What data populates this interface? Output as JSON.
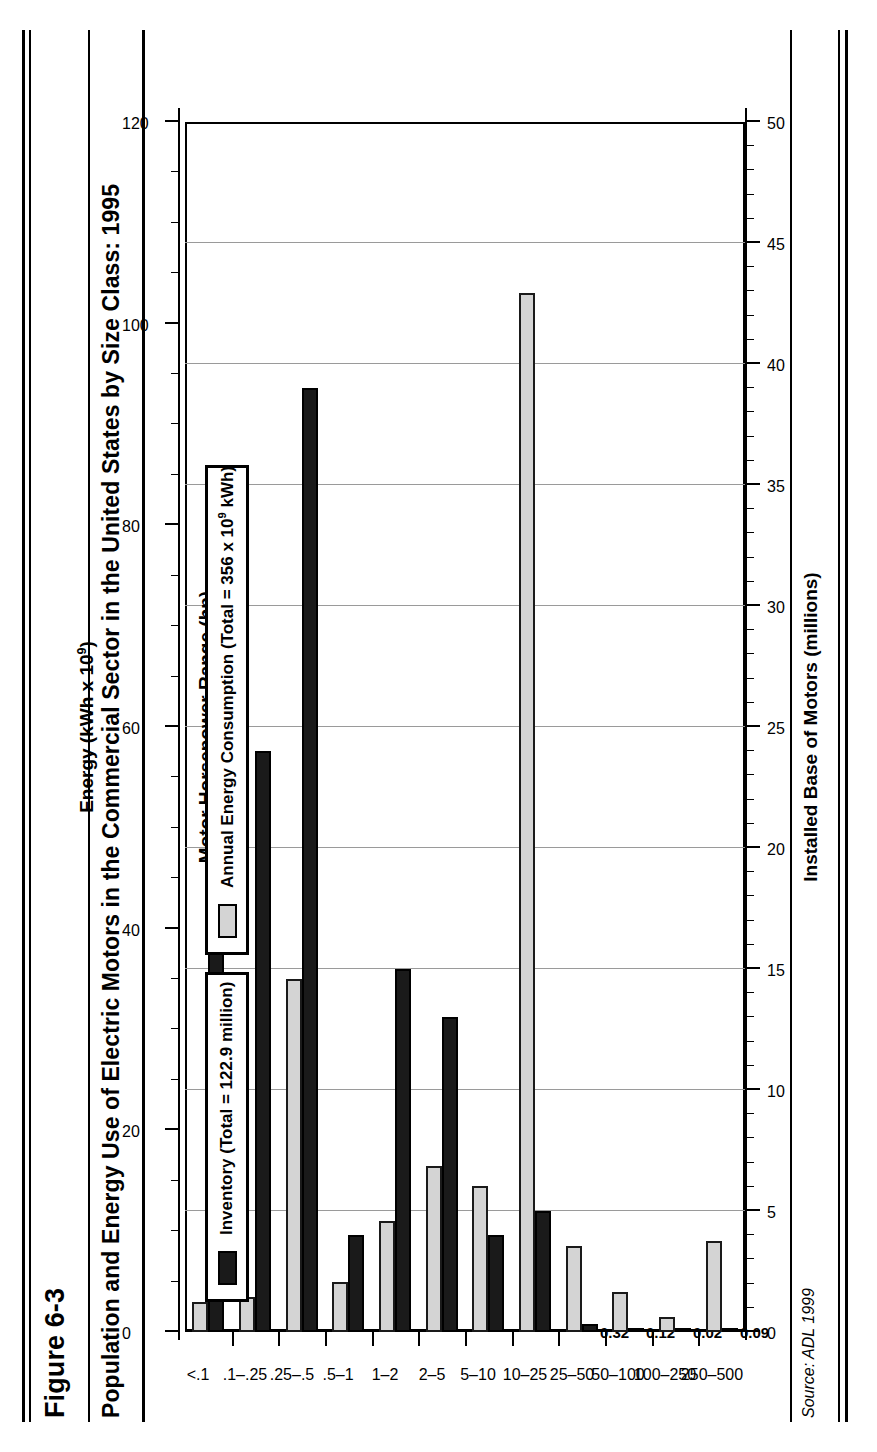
{
  "figure": {
    "number": "Figure 6-3",
    "title": "Population and Energy Use of Electric Motors in the Commercial Sector in the United States by Size Class: 1995",
    "source": "Source: ADL 1999"
  },
  "legend": {
    "inventory": {
      "label": "Inventory (Total = 122.9 million)",
      "swatch": "black-square-swatch",
      "color": "#1a1a1a"
    },
    "energy": {
      "label": "Annual Energy Consumption (Total = 356 x 10",
      "label_sup": "9",
      "label_tail": " kWh)",
      "swatch": "gray-square-swatch",
      "color": "#d4d4d4"
    }
  },
  "axes": {
    "left_title": "Installed Base of Motors (millions)",
    "left_ticks": [
      "0",
      "5",
      "10",
      "15",
      "20",
      "25",
      "30",
      "35",
      "40",
      "45",
      "50"
    ],
    "left_min": 0,
    "left_max": 50,
    "right_title_pre": "Energy (kWh x 10",
    "right_title_sup": "9",
    "right_title_post": ")",
    "right_ticks": [
      "0",
      "20",
      "40",
      "60",
      "80",
      "100",
      "120"
    ],
    "right_min": 0,
    "right_max": 120,
    "category_title": "Motor Horsepower Range (hp)"
  },
  "chart_data": {
    "type": "bar",
    "title": "Population and Energy Use of Electric Motors in the Commercial Sector in the United States by Size Class: 1995",
    "subtitle": "",
    "orientation": "horizontal",
    "xlabel": "Motor Horsepower Range (hp)",
    "ylabel": "Installed Base of Motors (millions)",
    "ylabel2": "Energy (kWh x 10^9)",
    "ylim": [
      0,
      50
    ],
    "ylim2": [
      0,
      120
    ],
    "grid": true,
    "legend_position": "top-left",
    "categories": [
      "<.1",
      ".1–.25",
      ".25–.5",
      ".5–1",
      "1–2",
      "2–5",
      "5–10",
      "10–25",
      "25–50",
      "50–100",
      "100–250",
      "250–500"
    ],
    "series": [
      {
        "name": "Inventory (Total = 122.9 million)",
        "unit": "millions",
        "axis": "left",
        "color": "#1a1a1a",
        "values": [
          23,
          24,
          39,
          4,
          15,
          13,
          4,
          5,
          0.32,
          0.12,
          0.02,
          0.09
        ],
        "data_labels": [
          "",
          "",
          "",
          "",
          "",
          "",
          "",
          "",
          "0.32",
          "0.12",
          "0.02",
          "0.09"
        ]
      },
      {
        "name": "Annual Energy Consumption (Total = 356 x 10^9 kWh)",
        "unit": "kWh x 10^9",
        "axis": "right",
        "color": "#d4d4d4",
        "values": [
          3.0,
          3.5,
          35.0,
          5.0,
          11.0,
          16.5,
          14.5,
          103.0,
          8.5,
          4.0,
          1.5,
          9.0
        ],
        "data_labels": [
          "",
          "",
          "",
          "",
          "",
          "",
          "",
          "",
          "",
          "",
          "",
          ""
        ]
      }
    ]
  }
}
